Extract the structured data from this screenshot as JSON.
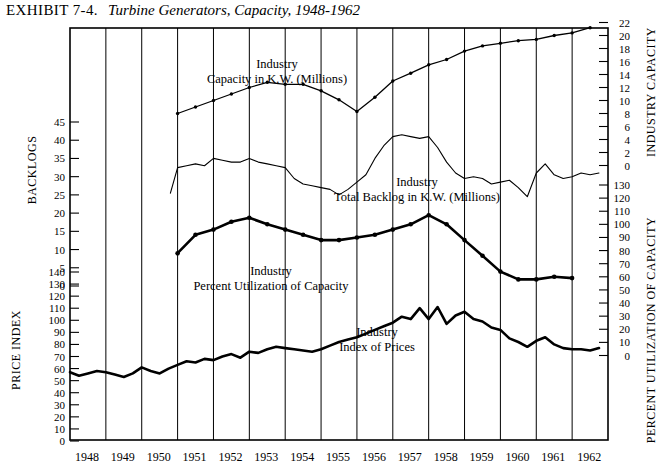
{
  "header": {
    "exhibit_label": "EXHIBIT 7-4.",
    "title": "Turbine Generators, Capacity, 1948-1962"
  },
  "axes": {
    "left_upper_name": "BACKLOGS",
    "left_lower_name": "PRICE INDEX",
    "right_upper_name": "INDUSTRY CAPACITY",
    "right_lower_name": "PERCENT UTILIZATION OF CAPACITY",
    "left_upper_ticks": [
      45,
      40,
      35,
      30,
      25,
      20,
      15,
      10,
      5,
      0
    ],
    "left_lower_ticks": [
      140,
      130,
      120,
      110,
      100,
      90,
      80,
      70,
      60,
      50,
      40,
      30,
      20,
      10,
      0
    ],
    "right_upper_ticks": [
      22,
      20,
      18,
      16,
      14,
      12,
      10,
      8,
      6,
      4,
      2,
      0
    ],
    "right_lower_ticks": [
      130,
      120,
      110,
      100,
      90,
      80,
      70,
      60,
      50,
      40,
      30,
      20,
      10,
      0
    ],
    "x_ticks": [
      1948,
      1949,
      1950,
      1951,
      1952,
      1953,
      1954,
      1955,
      1956,
      1957,
      1958,
      1959,
      1960,
      1961,
      1962
    ]
  },
  "annotations": {
    "capacity": [
      "Industry",
      "Capacity in K.W. (Millions)"
    ],
    "backlog": [
      "Industry",
      "Total Backlog in K.W. (Millions)"
    ],
    "utilization": [
      "Industry",
      "Percent Utilization of Capacity"
    ],
    "prices": [
      "Industry",
      "Index of Prices"
    ]
  },
  "chart_data": {
    "type": "line",
    "title": "Turbine Generators, Capacity, 1948-1962",
    "xlabel": "",
    "xlim": [
      1948,
      1963
    ],
    "grid": "vertical",
    "legend": "inline-annotations",
    "series": [
      {
        "name": "Industry Capacity in K.W. (Millions)",
        "ylabel": "INDUSTRY CAPACITY",
        "ylim": [
          0,
          22
        ],
        "axis": "right-upper",
        "style": "thin-with-markers",
        "x": [
          1951.0,
          1951.5,
          1952.0,
          1952.5,
          1953.0,
          1953.5,
          1954.0,
          1954.5,
          1955.0,
          1955.5,
          1956.0,
          1956.5,
          1957.0,
          1957.5,
          1958.0,
          1958.5,
          1959.0,
          1959.5,
          1960.0,
          1960.5,
          1961.0,
          1961.5,
          1962.0,
          1962.5
        ],
        "y": [
          8.0,
          9.0,
          10.0,
          11.0,
          12.0,
          12.8,
          12.5,
          12.5,
          11.5,
          10.1,
          8.3,
          10.5,
          13.0,
          14.2,
          15.5,
          16.3,
          17.6,
          18.4,
          18.8,
          19.2,
          19.4,
          20.0,
          20.4,
          21.2
        ]
      },
      {
        "name": "Industry Total Backlog in K.W. (Millions)",
        "ylabel": "BACKLOGS",
        "ylim": [
          0,
          45
        ],
        "axis": "left-upper",
        "style": "thin-jagged",
        "x": [
          1950.8,
          1951.0,
          1951.25,
          1951.5,
          1951.75,
          1952.0,
          1952.25,
          1952.5,
          1952.75,
          1953.0,
          1953.25,
          1953.5,
          1953.75,
          1954.0,
          1954.25,
          1954.5,
          1954.75,
          1955.0,
          1955.25,
          1955.5,
          1955.75,
          1956.0,
          1956.25,
          1956.5,
          1956.75,
          1957.0,
          1957.25,
          1957.5,
          1957.75,
          1958.0,
          1958.25,
          1958.5,
          1958.75,
          1959.0,
          1959.25,
          1959.5,
          1959.75,
          1960.0,
          1960.25,
          1960.5,
          1960.75,
          1961.0,
          1961.25,
          1961.5,
          1961.75,
          1962.0,
          1962.25,
          1962.5,
          1962.75
        ],
        "y": [
          25.5,
          32.5,
          33.0,
          33.5,
          33.0,
          35.0,
          34.5,
          34.0,
          34.0,
          35.0,
          34.0,
          33.5,
          33.0,
          32.5,
          29.5,
          28.0,
          27.5,
          27.0,
          26.5,
          25.0,
          26.5,
          28.5,
          30.5,
          35.0,
          38.5,
          41.0,
          41.5,
          41.0,
          40.5,
          41.0,
          38.0,
          34.0,
          31.0,
          29.5,
          30.0,
          29.5,
          28.0,
          28.5,
          29.0,
          27.0,
          24.5,
          31.0,
          33.5,
          30.5,
          29.5,
          30.0,
          31.0,
          30.5,
          31.0
        ]
      },
      {
        "name": "Industry Percent Utilization of Capacity",
        "ylabel": "PERCENT UTILIZATION OF CAPACITY",
        "ylim": [
          0,
          130
        ],
        "axis": "right-lower",
        "style": "thick-with-markers",
        "x": [
          1951.0,
          1951.5,
          1952.0,
          1952.5,
          1953.0,
          1953.5,
          1954.0,
          1954.5,
          1955.0,
          1955.5,
          1956.0,
          1956.5,
          1957.0,
          1957.5,
          1958.0,
          1958.5,
          1959.0,
          1959.5,
          1960.0,
          1960.5,
          1961.0,
          1961.5,
          1962.0
        ],
        "y": [
          78,
          92,
          96,
          102,
          105,
          100,
          96,
          92,
          88,
          88,
          90,
          92,
          96,
          100,
          107,
          100,
          88,
          76,
          64,
          58,
          58,
          60,
          59
        ]
      },
      {
        "name": "Industry Index of Prices",
        "ylabel": "PRICE INDEX",
        "ylim": [
          0,
          140
        ],
        "axis": "left-lower",
        "style": "thick-jagged",
        "x": [
          1948.0,
          1948.25,
          1948.5,
          1948.75,
          1949.0,
          1949.25,
          1949.5,
          1949.75,
          1950.0,
          1950.25,
          1950.5,
          1950.75,
          1951.0,
          1951.25,
          1951.5,
          1951.75,
          1952.0,
          1952.25,
          1952.5,
          1952.75,
          1953.0,
          1953.25,
          1953.5,
          1953.75,
          1954.0,
          1954.25,
          1954.5,
          1954.75,
          1955.0,
          1955.25,
          1955.5,
          1955.75,
          1956.0,
          1956.25,
          1956.5,
          1956.75,
          1957.0,
          1957.25,
          1957.5,
          1957.75,
          1958.0,
          1958.25,
          1958.5,
          1958.75,
          1959.0,
          1959.25,
          1959.5,
          1959.75,
          1960.0,
          1960.25,
          1960.5,
          1960.75,
          1961.0,
          1961.25,
          1961.5,
          1961.75,
          1962.0,
          1962.25,
          1962.5,
          1962.75
        ],
        "y": [
          57,
          54,
          56,
          58,
          57,
          55,
          53,
          56,
          61,
          58,
          56,
          60,
          63,
          66,
          65,
          68,
          67,
          70,
          72,
          69,
          74,
          73,
          76,
          78,
          77,
          76,
          75,
          74,
          76,
          79,
          82,
          84,
          86,
          89,
          92,
          95,
          98,
          103,
          101,
          110,
          101,
          111,
          97,
          104,
          107,
          101,
          99,
          94,
          92,
          85,
          82,
          78,
          83,
          86,
          80,
          77,
          76,
          76,
          75,
          77
        ]
      }
    ]
  }
}
